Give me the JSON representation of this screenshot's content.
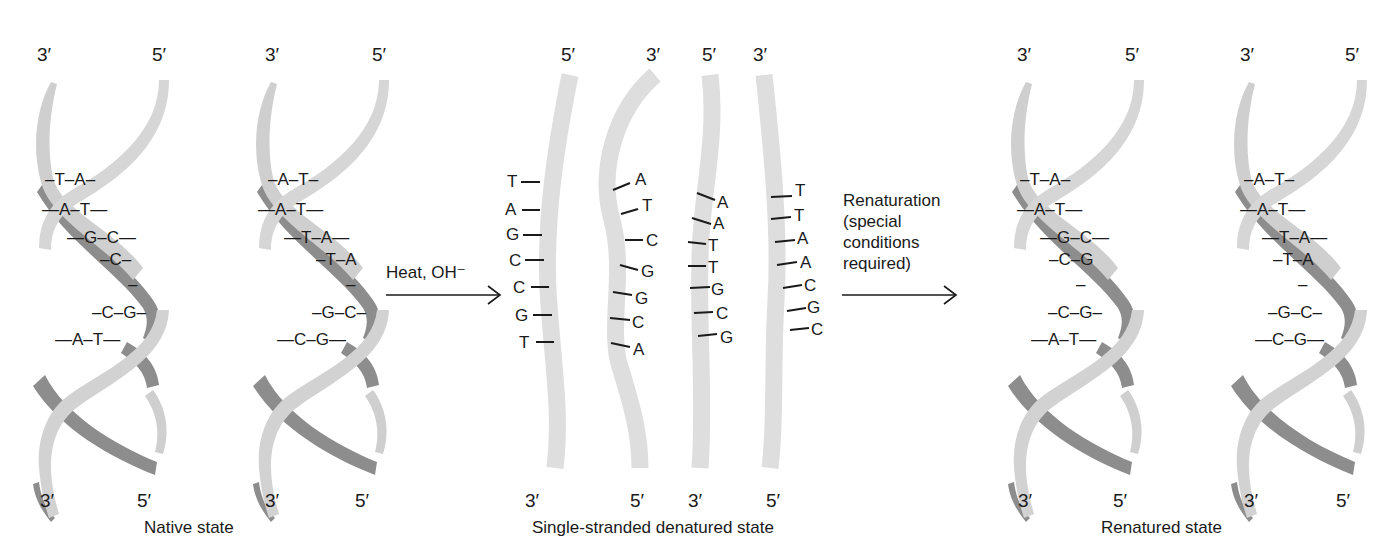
{
  "figure": {
    "colors": {
      "dark_strand": "#8c8c8c",
      "light_strand": "#d2d2d2",
      "single_strand": "#dedede",
      "text": "#1a1a1a",
      "arrow": "#1a1a1a"
    }
  },
  "native": {
    "caption": "Native state",
    "helices": [
      {
        "top_left": "3′",
        "top_right": "5′",
        "bottom_left": "3′",
        "bottom_right": "5′",
        "base_pairs": [
          "–T–A–",
          "—A–T—",
          "—G–C—",
          "–C–",
          "–",
          "–C–G–",
          "—A–T—"
        ]
      },
      {
        "top_left": "3′",
        "top_right": "5′",
        "bottom_left": "3′",
        "bottom_right": "5′",
        "base_pairs": [
          "–A–T–",
          "—A–T—",
          "—T–A—",
          "–T–A",
          "–",
          "–G–C–",
          "—C–G—"
        ]
      }
    ]
  },
  "step1": {
    "label": "Heat, OH⁻"
  },
  "denatured": {
    "caption": "Single-stranded denatured state",
    "strands": [
      {
        "top": "5′",
        "bottom": "3′",
        "bases": [
          "T",
          "A",
          "G",
          "C",
          "C",
          "G",
          "T"
        ]
      },
      {
        "top": "3′",
        "bottom": "5′",
        "bases": [
          "A",
          "T",
          "C",
          "G",
          "G",
          "C",
          "A"
        ]
      },
      {
        "top": "5′",
        "bottom": "3′",
        "bases": [
          "A",
          "A",
          "T",
          "T",
          "G",
          "C",
          "G"
        ]
      },
      {
        "top": "3′",
        "bottom": "5′",
        "bases": [
          "T",
          "T",
          "A",
          "A",
          "C",
          "G",
          "C"
        ]
      }
    ]
  },
  "step2": {
    "label_lines": [
      "Renaturation",
      "(special",
      "conditions",
      "required)"
    ]
  },
  "renatured": {
    "caption": "Renatured state",
    "helices": [
      {
        "top_left": "3′",
        "top_right": "5′",
        "bottom_left": "3′",
        "bottom_right": "5′",
        "base_pairs": [
          "–T–A–",
          "—A–T—",
          "—G–C—",
          "–C–G",
          "–",
          "–C–G–",
          "—A–T—"
        ]
      },
      {
        "top_left": "3′",
        "top_right": "5′",
        "bottom_left": "3′",
        "bottom_right": "5′",
        "base_pairs": [
          "–A–T–",
          "—A–T—",
          "—T–A—",
          "–T–A",
          "–",
          "–G–C–",
          "—C–G—"
        ]
      }
    ]
  }
}
